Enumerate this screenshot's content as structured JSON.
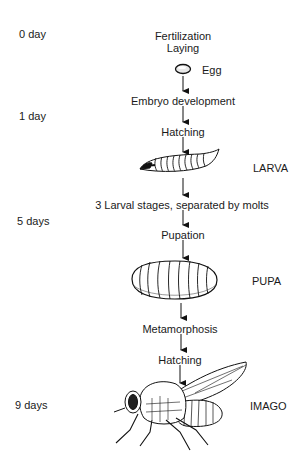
{
  "diagram": {
    "timeline": [
      {
        "label": "0 day"
      },
      {
        "label": "1 day"
      },
      {
        "label": "5 days"
      },
      {
        "label": "9 days"
      }
    ],
    "steps": [
      {
        "label": "Fertilization"
      },
      {
        "label": "Laying"
      },
      {
        "label": "Embryo development"
      },
      {
        "label": "Hatching"
      },
      {
        "label": "3 Larval stages, separated by molts"
      },
      {
        "label": "Pupation"
      },
      {
        "label": "Metamorphosis"
      },
      {
        "label": "Hatching"
      }
    ],
    "stages": [
      {
        "label": "Egg"
      },
      {
        "label": "LARVA"
      },
      {
        "label": "PUPA"
      },
      {
        "label": "IMAGO"
      }
    ]
  }
}
